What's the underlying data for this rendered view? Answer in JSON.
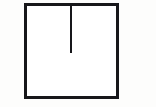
{
  "figure": {
    "title": "Slotted square outline",
    "type": "line-drawing",
    "canvas": {
      "width": 156,
      "height": 107,
      "background_color": "#fdfdfc"
    },
    "style": {
      "stroke_color": "#17171a",
      "fill_color": "#ffffff",
      "square_stroke_width": 3,
      "slot_stroke_width": 2.4
    },
    "shapes": [
      {
        "name": "square-outline",
        "kind": "rect",
        "x": 24,
        "y": 3,
        "width": 95,
        "height": 96,
        "stroke_color": "#17171a",
        "fill_color": "#ffffff",
        "stroke_width": 3
      },
      {
        "name": "vertical-slot",
        "kind": "line",
        "x1": 71,
        "y1": 3,
        "x2": 71,
        "y2": 53,
        "stroke_color": "#17171a",
        "stroke_width": 2.4,
        "length": 50,
        "orientation": "vertical"
      }
    ],
    "annotations": []
  }
}
